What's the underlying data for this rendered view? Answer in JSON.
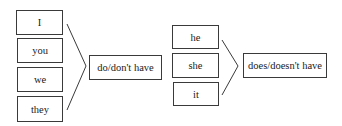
{
  "diagram": {
    "groups": [
      {
        "subjects": [
          "I",
          "you",
          "we",
          "they"
        ],
        "verb_form": "do/don't have"
      },
      {
        "subjects": [
          "he",
          "she",
          "it"
        ],
        "verb_form": "does/doesn't have"
      }
    ],
    "colors": {
      "line": "#3a3a3a",
      "text": "#1a1a1a",
      "background": "#ffffff"
    }
  }
}
